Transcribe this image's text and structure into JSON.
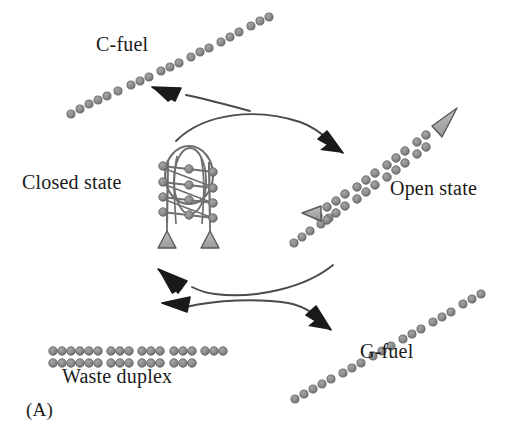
{
  "figure": {
    "panel_label": "(A)",
    "background": "#ffffff",
    "width": 510,
    "height": 448
  },
  "labels": {
    "c_fuel": "C-fuel",
    "closed_state": "Closed state",
    "open_state": "Open state",
    "g_fuel": "G-fuel",
    "waste_duplex": "Waste duplex"
  },
  "colors": {
    "bead": "#8a8a8a",
    "bead_stroke": "#5e5e5e",
    "strand_line": "#6f6f6f",
    "arrow": "#1a1a1a",
    "triangle_fill": "#a8a8a8",
    "triangle_stroke": "#5a5a5a",
    "text": "#1a1a1a"
  },
  "diagram": {
    "type": "dna-nanomachine-cycle",
    "nodes": [
      {
        "name": "c-fuel-strand",
        "label": "C-fuel",
        "kind": "single-strand-beads",
        "orientation": "diagonal-up-right",
        "bead_count": 22,
        "start": [
          68,
          115
        ],
        "end": [
          250,
          14
        ]
      },
      {
        "name": "closed-state-complex",
        "label": "Closed state",
        "kind": "hairpin-ladder-complex",
        "rungs": 4,
        "loop": true,
        "triangles": 2,
        "center": [
          190,
          185
        ]
      },
      {
        "name": "open-state-duplex",
        "label": "Open state",
        "kind": "double-strand-beads",
        "orientation": "diagonal-up-right",
        "triangles": 2,
        "start": [
          293,
          243
        ],
        "end": [
          443,
          118
        ]
      },
      {
        "name": "g-fuel-strand",
        "label": "G-fuel",
        "kind": "single-strand-beads",
        "orientation": "diagonal-up-right",
        "bead_count": 20,
        "start": [
          292,
          400
        ],
        "end": [
          420,
          290
        ]
      },
      {
        "name": "waste-duplex-strand",
        "label": "Waste duplex",
        "kind": "double-strand-beads",
        "orientation": "horizontal",
        "top_row_groups": 5,
        "bottom_row_groups": 4,
        "start": [
          50,
          350
        ],
        "end": [
          228,
          364
        ]
      }
    ],
    "arrows": [
      {
        "name": "arrow-closed-to-open",
        "from": "closed-state-complex",
        "to": "open-state-duplex",
        "style": "curved",
        "head": "end"
      },
      {
        "name": "arrow-cfuel-consumed",
        "from": "open-state-path",
        "to": "c-fuel-strand",
        "style": "curved",
        "head": "end"
      },
      {
        "name": "arrow-open-to-closed",
        "from": "open-state-duplex",
        "to": "closed-state-complex",
        "style": "curved",
        "head": "end"
      },
      {
        "name": "arrow-gfuel-produced",
        "from": "waste-duplex-strand",
        "to": "g-fuel-strand",
        "style": "curved",
        "head": "end"
      }
    ]
  }
}
